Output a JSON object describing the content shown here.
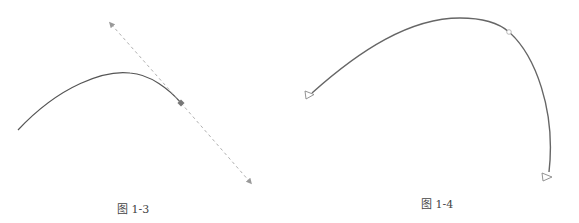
{
  "figures": [
    {
      "id": "fig-1-3",
      "caption": "图 1-3",
      "description": "Curve with a tangent handle: solid curve ending at an anchor point, dashed tangent line with arrowheads at both ends",
      "curve": {
        "start": [
          18,
          130
        ],
        "control": [
          125,
          55
        ],
        "end": [
          181,
          103
        ],
        "color": "#555555"
      },
      "anchor_point": {
        "x": 181,
        "y": 103,
        "color": "#777777"
      },
      "tangent_line": {
        "start": [
          111,
          24
        ],
        "end": [
          250,
          182
        ],
        "style": "dashed",
        "color": "#aaaaaa",
        "arrowheads": "both"
      }
    },
    {
      "id": "fig-1-4",
      "caption": "图 1-4",
      "description": "Open arc with hollow triangle markers at both endpoints and a small hollow circle on the curve",
      "curve": {
        "start": [
          312,
          94
        ],
        "control1": [
          400,
          10
        ],
        "control2": [
          500,
          5
        ],
        "mid": [
          509,
          32
        ],
        "end": [
          549,
          173
        ],
        "color": "#666666"
      },
      "midpoint_marker": {
        "x": 509,
        "y": 32,
        "shape": "circle",
        "fill": "#ffffff"
      },
      "end_markers": [
        {
          "x": 308,
          "y": 95,
          "shape": "hollow-triangle"
        },
        {
          "x": 546,
          "y": 177,
          "shape": "hollow-triangle"
        }
      ]
    }
  ],
  "colors": {
    "curve": "#555555",
    "tangent": "#aaaaaa",
    "marker_stroke": "#888888",
    "caption": "#444444"
  }
}
